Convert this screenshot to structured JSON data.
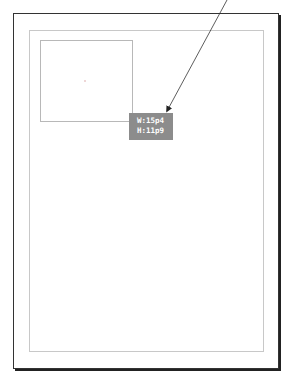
{
  "canvas": {
    "page": {
      "x": 13,
      "y": 13,
      "width": 266,
      "height": 356
    },
    "margin_guide": {
      "x": 29,
      "y": 30,
      "width": 235,
      "height": 322
    },
    "frame": {
      "x": 40,
      "y": 40,
      "width": 93,
      "height": 82
    }
  },
  "tooltip": {
    "width_label": "W:15p4",
    "height_label": "H:11p9"
  },
  "arrow": {
    "from": [
      227,
      0
    ],
    "to": [
      166,
      113
    ],
    "color": "#222222"
  }
}
